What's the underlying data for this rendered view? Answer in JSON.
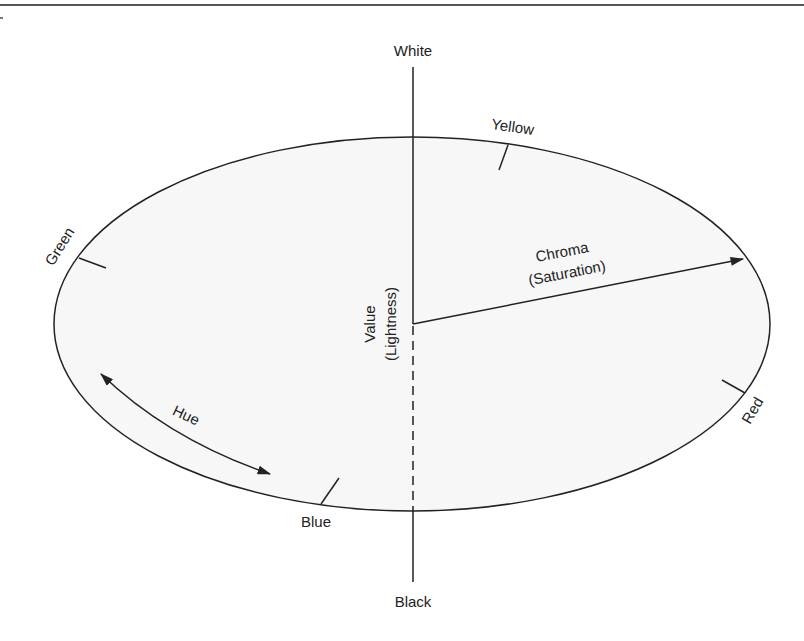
{
  "diagram": {
    "axis": {
      "top_label": "White",
      "bottom_label": "Black",
      "value_label_line1": "Value",
      "value_label_line2": "(Lightness)"
    },
    "chroma": {
      "line1": "Chroma",
      "line2": "(Saturation)"
    },
    "hue": {
      "label": "Hue"
    },
    "hues": {
      "yellow": "Yellow",
      "green": "Green",
      "red": "Red",
      "blue": "Blue"
    },
    "colors": {
      "stroke": "#222222",
      "fill": "#f7f7f7",
      "rule": "#555555"
    }
  }
}
